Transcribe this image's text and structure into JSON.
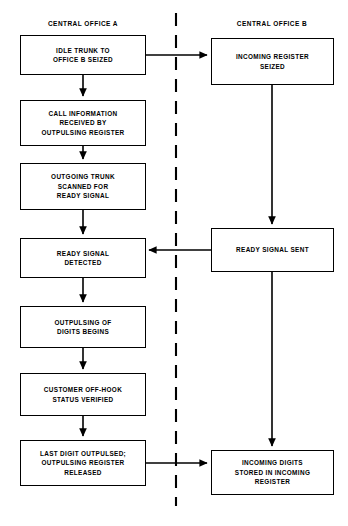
{
  "diagram": {
    "title_columns": [
      {
        "id": "office-a",
        "label": "CENTRAL OFFICE A"
      },
      {
        "id": "office-b",
        "label": "CENTRAL OFFICE B"
      }
    ],
    "divider": {
      "style": "dashed-vertical",
      "color": "#000000"
    },
    "line_color": "#000000",
    "box_fill": "#ffffff",
    "nodes": [
      {
        "id": "idle-trunk",
        "label": "IDLE TRUNK TO\nOFFICE B SEIZED"
      },
      {
        "id": "call-information",
        "label": "CALL INFORMATION\nRECEIVED BY\nOUTPULSING REGISTER"
      },
      {
        "id": "outgoing-trunk",
        "label": "OUTGOING TRUNK\nSCANNED FOR\nREADY SIGNAL"
      },
      {
        "id": "ready-detected",
        "label": "READY SIGNAL\nDETECTED"
      },
      {
        "id": "outpulsing-digits",
        "label": "OUTPULSING OF\nDIGITS BEGINS"
      },
      {
        "id": "customer-offhook",
        "label": "CUSTOMER OFF-HOOK\nSTATUS VERIFIED"
      },
      {
        "id": "last-digit",
        "label": "LAST DIGIT OUTPULSED;\nOUTPULSING REGISTER\nRELEASED"
      },
      {
        "id": "incoming-register",
        "label": "INCOMING REGISTER\nSEIZED"
      },
      {
        "id": "ready-sent",
        "label": "READY  SIGNAL SENT"
      },
      {
        "id": "incoming-digits",
        "label": "INCOMING DIGITS\nSTORED IN INCOMING\nREGISTER"
      }
    ],
    "connections": [
      {
        "id": "idle-to-call",
        "from": "idle-trunk",
        "to": "call-information"
      },
      {
        "id": "call-to-outgoing",
        "from": "call-information",
        "to": "outgoing-trunk"
      },
      {
        "id": "outgoing-to-ready",
        "from": "outgoing-trunk",
        "to": "ready-detected"
      },
      {
        "id": "ready-to-outpulsing",
        "from": "ready-detected",
        "to": "outpulsing-digits"
      },
      {
        "id": "outpulsing-to-customer",
        "from": "outpulsing-digits",
        "to": "customer-offhook"
      },
      {
        "id": "customer-to-lastdigit",
        "from": "customer-offhook",
        "to": "last-digit"
      },
      {
        "id": "idle-to-incoming",
        "from": "idle-trunk",
        "to": "incoming-register"
      },
      {
        "id": "incoming-to-readysent",
        "from": "incoming-register",
        "to": "ready-sent"
      },
      {
        "id": "readysent-to-detected",
        "from": "ready-sent",
        "to": "ready-detected"
      },
      {
        "id": "readysent-to-digits",
        "from": "ready-sent",
        "to": "incoming-digits"
      },
      {
        "id": "lastdigit-to-digits",
        "from": "last-digit",
        "to": "incoming-digits"
      }
    ]
  }
}
